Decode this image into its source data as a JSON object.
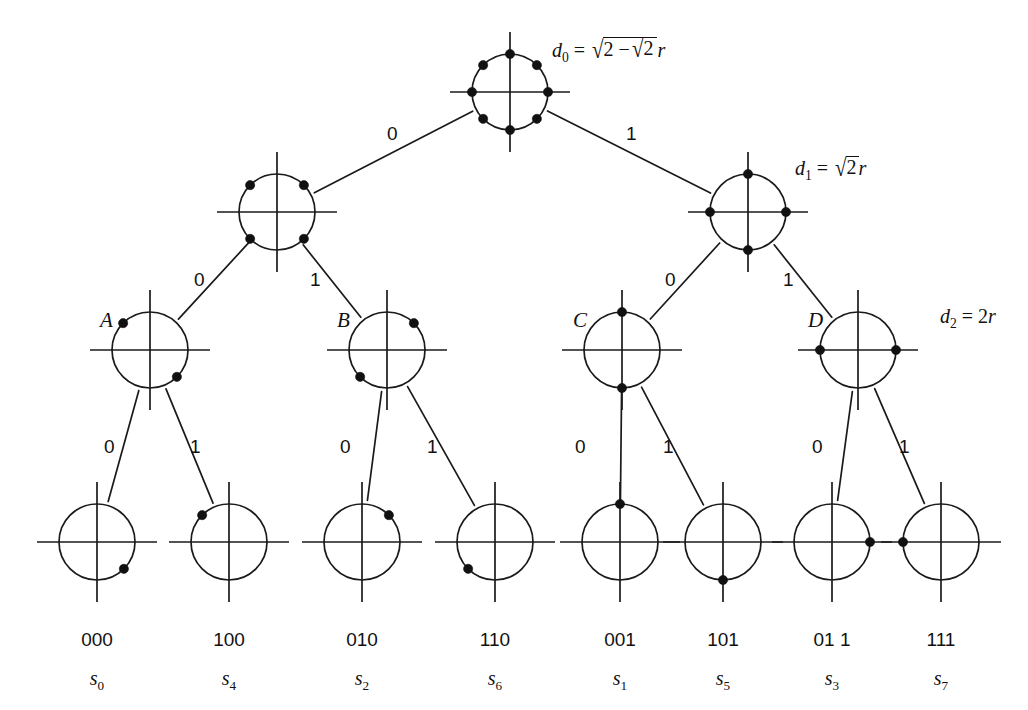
{
  "diagram": {
    "type": "set-partitioning-tree",
    "background_color": "#ffffff",
    "ink_color": "#111111"
  },
  "distance_labels": [
    {
      "id": "d0",
      "symbol": "d",
      "subscript": "0",
      "equals": "=",
      "outer_radical": "√",
      "inner_text_left": "2",
      "minus": "−",
      "inner_radical": "√",
      "inner_text_right": "2",
      "suffix": "r",
      "plain": "d0 = √(2−√2) r",
      "x": 552,
      "y": 38
    },
    {
      "id": "d1",
      "symbol": "d",
      "subscript": "1",
      "equals": "=",
      "radical": "√",
      "radicand": "2",
      "suffix": "r",
      "plain": "d1 = √2 r",
      "x": 795,
      "y": 157
    },
    {
      "id": "d2",
      "symbol": "d",
      "subscript": "2",
      "equals": "=",
      "value": "2",
      "suffix": "r",
      "plain": "d2 = 2r",
      "x": 940,
      "y": 306
    }
  ],
  "node_letters": [
    {
      "id": "A",
      "label": "A",
      "x": 100,
      "y": 310
    },
    {
      "id": "B",
      "label": "B",
      "x": 337,
      "y": 310
    },
    {
      "id": "C",
      "label": "C",
      "x": 573,
      "y": 310
    },
    {
      "id": "D",
      "label": "D",
      "x": 808,
      "y": 310
    }
  ],
  "edge_labels": [
    {
      "id": "e-root-0",
      "label": "0",
      "x": 387,
      "y": 124
    },
    {
      "id": "e-root-1",
      "label": "1",
      "x": 626,
      "y": 124
    },
    {
      "id": "e-l1a-0",
      "label": "0",
      "x": 194,
      "y": 270
    },
    {
      "id": "e-l1a-1",
      "label": "1",
      "x": 310,
      "y": 270
    },
    {
      "id": "e-l1b-0",
      "label": "0",
      "x": 665,
      "y": 270
    },
    {
      "id": "e-l1b-1",
      "label": "1",
      "x": 783,
      "y": 270
    },
    {
      "id": "e-A-0",
      "label": "0",
      "x": 104,
      "y": 437
    },
    {
      "id": "e-A-1",
      "label": "1",
      "x": 190,
      "y": 437
    },
    {
      "id": "e-B-0",
      "label": "0",
      "x": 340,
      "y": 437
    },
    {
      "id": "e-B-1",
      "label": "1",
      "x": 427,
      "y": 437
    },
    {
      "id": "e-C-0",
      "label": "0",
      "x": 575,
      "y": 437
    },
    {
      "id": "e-C-1",
      "label": "1",
      "x": 663,
      "y": 437
    },
    {
      "id": "e-D-0",
      "label": "0",
      "x": 812,
      "y": 437
    },
    {
      "id": "e-D-1",
      "label": "1",
      "x": 899,
      "y": 437
    }
  ],
  "leaves": [
    {
      "id": "leaf-000",
      "bits": "000",
      "symbol": "s",
      "subscript": "0",
      "cx": 97,
      "point_angle_deg": 315
    },
    {
      "id": "leaf-100",
      "bits": "100",
      "symbol": "s",
      "subscript": "4",
      "cx": 229,
      "point_angle_deg": 135
    },
    {
      "id": "leaf-010",
      "bits": "010",
      "symbol": "s",
      "subscript": "2",
      "cx": 362,
      "point_angle_deg": 45
    },
    {
      "id": "leaf-110",
      "bits": "110",
      "symbol": "s",
      "subscript": "6",
      "cx": 495,
      "point_angle_deg": 225
    },
    {
      "id": "leaf-001",
      "bits": "001",
      "symbol": "s",
      "subscript": "1",
      "cx": 620,
      "point_angle_deg": 90
    },
    {
      "id": "leaf-101",
      "bits": "101",
      "symbol": "s",
      "subscript": "5",
      "cx": 723,
      "point_angle_deg": 270
    },
    {
      "id": "leaf-011",
      "bits": "01 1",
      "symbol": "s",
      "subscript": "3",
      "cx": 832,
      "point_angle_deg": 0
    },
    {
      "id": "leaf-111",
      "bits": "111",
      "symbol": "s",
      "subscript": "7",
      "cx": 941,
      "point_angle_deg": 180
    }
  ],
  "nodes": [
    {
      "id": "root",
      "level": 0,
      "cx": 510,
      "cy": 92,
      "r": 38,
      "point_angles_deg": [
        0,
        45,
        90,
        135,
        180,
        225,
        270,
        315
      ],
      "point_count": 8
    },
    {
      "id": "level1-left",
      "level": 1,
      "cx": 277,
      "cy": 212,
      "r": 38,
      "point_angles_deg": [
        45,
        135,
        225,
        315
      ],
      "point_count": 4
    },
    {
      "id": "level1-right",
      "level": 1,
      "cx": 748,
      "cy": 212,
      "r": 38,
      "point_angles_deg": [
        0,
        90,
        180,
        270
      ],
      "point_count": 4
    },
    {
      "id": "node-A",
      "level": 2,
      "cx": 150,
      "cy": 350,
      "r": 38,
      "point_angles_deg": [
        135,
        315
      ],
      "point_count": 2
    },
    {
      "id": "node-B",
      "level": 2,
      "cx": 387,
      "cy": 350,
      "r": 38,
      "point_angles_deg": [
        45,
        225
      ],
      "point_count": 2
    },
    {
      "id": "node-C",
      "level": 2,
      "cx": 622,
      "cy": 350,
      "r": 38,
      "point_angles_deg": [
        90,
        270
      ],
      "point_count": 2
    },
    {
      "id": "node-D",
      "level": 2,
      "cx": 858,
      "cy": 350,
      "r": 38,
      "point_angles_deg": [
        0,
        180
      ],
      "point_count": 2
    }
  ],
  "leaf_geometry": {
    "cy": 542,
    "r": 38
  },
  "bit_label_y": 630,
  "symbol_label_y": 668
}
